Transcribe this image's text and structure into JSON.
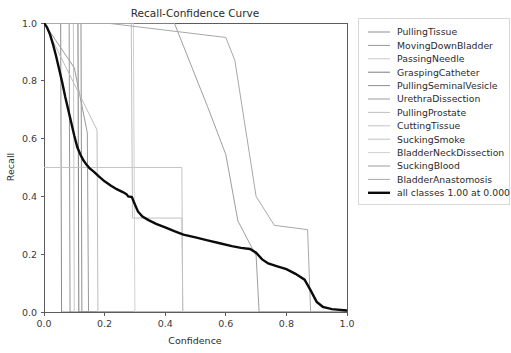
{
  "chart_data": {
    "type": "line",
    "title": "Recall-Confidence Curve",
    "xlabel": "Confidence",
    "ylabel": "Recall",
    "xlim": [
      0.0,
      1.0
    ],
    "ylim": [
      0.0,
      1.0
    ],
    "xticks": [
      "0.0",
      "0.2",
      "0.4",
      "0.6",
      "0.8",
      "1.0"
    ],
    "xtick_values": [
      0.0,
      0.2,
      0.4,
      0.6,
      0.8,
      1.0
    ],
    "yticks": [
      "0.0",
      "0.2",
      "0.4",
      "0.6",
      "0.8",
      "1.0"
    ],
    "ytick_values": [
      0.0,
      0.2,
      0.4,
      0.6,
      0.8,
      1.0
    ],
    "grid": false,
    "legend_position": "right-outside",
    "series": [
      {
        "name": "PullingTissue",
        "color": "#8c8c8c",
        "width": 1.0,
        "points": [
          [
            0.0,
            1.0
          ],
          [
            0.055,
            1.0
          ],
          [
            0.058,
            0.0
          ],
          [
            1.0,
            0.0
          ]
        ]
      },
      {
        "name": "MovingDownBladder",
        "color": "#969696",
        "width": 1.0,
        "points": [
          [
            0.0,
            1.0
          ],
          [
            0.083,
            1.0
          ],
          [
            0.086,
            0.0
          ],
          [
            1.0,
            0.0
          ]
        ]
      },
      {
        "name": "PassingNeedle",
        "color": "#c8c8c8",
        "width": 1.0,
        "points": [
          [
            0.0,
            1.0
          ],
          [
            0.097,
            1.0
          ],
          [
            0.1,
            0.0
          ],
          [
            1.0,
            0.0
          ]
        ]
      },
      {
        "name": "GraspingCatheter",
        "color": "#7d7d7d",
        "width": 1.0,
        "points": [
          [
            0.0,
            1.0
          ],
          [
            0.112,
            1.0
          ],
          [
            0.115,
            0.0
          ],
          [
            1.0,
            0.0
          ]
        ]
      },
      {
        "name": "PullingSeminalVesicle",
        "color": "#8f8f8f",
        "width": 1.0,
        "points": [
          [
            0.0,
            1.0
          ],
          [
            0.122,
            1.0
          ],
          [
            0.125,
            0.0
          ],
          [
            1.0,
            0.0
          ]
        ]
      },
      {
        "name": "UrethraDissection",
        "color": "#9a9a9a",
        "width": 1.0,
        "points": [
          [
            0.0,
            1.0
          ],
          [
            0.1,
            0.845
          ],
          [
            0.143,
            0.62
          ],
          [
            0.147,
            0.0
          ],
          [
            1.0,
            0.0
          ]
        ]
      },
      {
        "name": "PullingProstate",
        "color": "#bdbdbd",
        "width": 1.0,
        "points": [
          [
            0.0,
            1.0
          ],
          [
            0.175,
            0.63
          ],
          [
            0.178,
            0.0
          ],
          [
            1.0,
            0.0
          ]
        ]
      },
      {
        "name": "CuttingTissue",
        "color": "#c4c4c4",
        "width": 1.0,
        "points": [
          [
            0.0,
            0.5
          ],
          [
            0.455,
            0.5
          ],
          [
            0.458,
            0.0
          ],
          [
            1.0,
            0.0
          ]
        ]
      },
      {
        "name": "SuckingSmoke",
        "color": "#c0c0c0",
        "width": 1.0,
        "points": [
          [
            0.0,
            1.0
          ],
          [
            0.288,
            1.0
          ],
          [
            0.292,
            0.325
          ],
          [
            0.455,
            0.325
          ],
          [
            0.458,
            0.0
          ],
          [
            1.0,
            0.0
          ]
        ]
      },
      {
        "name": "BladderNeckDissection",
        "color": "#d0d0d0",
        "width": 1.0,
        "points": [
          [
            0.0,
            1.0
          ],
          [
            0.295,
            1.0
          ],
          [
            0.3,
            0.0
          ],
          [
            1.0,
            0.0
          ]
        ]
      },
      {
        "name": "SuckingBlood",
        "color": "#9e9e9e",
        "width": 1.0,
        "points": [
          [
            0.0,
            1.0
          ],
          [
            0.43,
            1.0
          ],
          [
            0.54,
            0.71
          ],
          [
            0.6,
            0.545
          ],
          [
            0.64,
            0.315
          ],
          [
            0.7,
            0.195
          ],
          [
            0.71,
            0.0
          ],
          [
            1.0,
            0.0
          ]
        ]
      },
      {
        "name": "BladderAnastomosis",
        "color": "#a8a8a8",
        "width": 1.0,
        "points": [
          [
            0.0,
            1.0
          ],
          [
            0.205,
            1.0
          ],
          [
            0.6,
            0.95
          ],
          [
            0.63,
            0.87
          ],
          [
            0.7,
            0.4
          ],
          [
            0.76,
            0.3
          ],
          [
            0.87,
            0.285
          ],
          [
            0.88,
            0.0
          ],
          [
            1.0,
            0.0
          ]
        ]
      },
      {
        "name": "all classes 1.00 at 0.000",
        "color": "#0b0b0b",
        "width": 2.4,
        "points": [
          [
            0.0,
            1.0
          ],
          [
            0.01,
            0.985
          ],
          [
            0.02,
            0.96
          ],
          [
            0.03,
            0.925
          ],
          [
            0.04,
            0.885
          ],
          [
            0.05,
            0.84
          ],
          [
            0.06,
            0.795
          ],
          [
            0.07,
            0.745
          ],
          [
            0.08,
            0.7
          ],
          [
            0.09,
            0.655
          ],
          [
            0.1,
            0.61
          ],
          [
            0.11,
            0.57
          ],
          [
            0.12,
            0.545
          ],
          [
            0.13,
            0.525
          ],
          [
            0.14,
            0.51
          ],
          [
            0.15,
            0.498
          ],
          [
            0.165,
            0.485
          ],
          [
            0.18,
            0.47
          ],
          [
            0.2,
            0.452
          ],
          [
            0.22,
            0.438
          ],
          [
            0.24,
            0.425
          ],
          [
            0.26,
            0.415
          ],
          [
            0.272,
            0.408
          ],
          [
            0.278,
            0.4
          ],
          [
            0.29,
            0.398
          ],
          [
            0.3,
            0.372
          ],
          [
            0.31,
            0.348
          ],
          [
            0.325,
            0.33
          ],
          [
            0.345,
            0.318
          ],
          [
            0.37,
            0.305
          ],
          [
            0.4,
            0.293
          ],
          [
            0.43,
            0.28
          ],
          [
            0.46,
            0.268
          ],
          [
            0.5,
            0.258
          ],
          [
            0.54,
            0.248
          ],
          [
            0.58,
            0.238
          ],
          [
            0.62,
            0.228
          ],
          [
            0.65,
            0.222
          ],
          [
            0.68,
            0.218
          ],
          [
            0.7,
            0.205
          ],
          [
            0.72,
            0.182
          ],
          [
            0.74,
            0.168
          ],
          [
            0.77,
            0.158
          ],
          [
            0.8,
            0.148
          ],
          [
            0.83,
            0.132
          ],
          [
            0.86,
            0.112
          ],
          [
            0.88,
            0.075
          ],
          [
            0.9,
            0.035
          ],
          [
            0.92,
            0.018
          ],
          [
            0.95,
            0.01
          ],
          [
            1.0,
            0.005
          ]
        ]
      }
    ]
  },
  "legend": {
    "entries": [
      "PullingTissue",
      "MovingDownBladder",
      "PassingNeedle",
      "GraspingCatheter",
      "PullingSeminalVesicle",
      "UrethraDissection",
      "PullingProstate",
      "CuttingTissue",
      "SuckingSmoke",
      "BladderNeckDissection",
      "SuckingBlood",
      "BladderAnastomosis",
      "all classes 1.00 at 0.000"
    ]
  }
}
